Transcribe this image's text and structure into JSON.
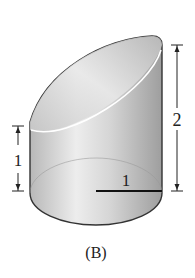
{
  "figure": {
    "caption": "(B)",
    "shape": "truncated-cylinder",
    "dimensions": {
      "left_height_label": "1",
      "right_height_label": "2",
      "radius_label": "1"
    },
    "colors": {
      "outline": "#333333",
      "fill_light": "#f2f2f2",
      "fill_dark": "#a8a8a8",
      "highlight": "#ffffff"
    }
  }
}
